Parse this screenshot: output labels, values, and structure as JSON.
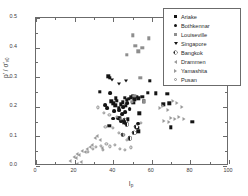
{
  "chart_data": {
    "type": "scatter",
    "title": "",
    "xlabel": "Ip",
    "xlabel_main": "I",
    "xlabel_sub": "p",
    "ylabel": "p'/σ'v0",
    "ylabel_num": "p'",
    "ylabel_den": "σ'",
    "ylabel_den_sub": "v0",
    "xlim": [
      0,
      100
    ],
    "ylim": [
      0.0,
      0.5
    ],
    "xticks": [
      0,
      20,
      40,
      60,
      80,
      100
    ],
    "xtick_labels": [
      "0",
      "20",
      "40",
      "60",
      "80",
      "100"
    ],
    "yticks": [
      0.0,
      0.1,
      0.2,
      0.3,
      0.4,
      0.5
    ],
    "ytick_labels": [
      "0.0",
      "0.1",
      "0.2",
      "0.3",
      "0.4",
      "0.5"
    ],
    "xminor_step": 10,
    "yminor_step": 0.05,
    "grid": false,
    "legend_position": "top-right",
    "series": [
      {
        "name": "Ariake",
        "marker": "filled-square",
        "color": "#141414",
        "points": [
          [
            33.0,
            0.251
          ],
          [
            37.5,
            0.303
          ],
          [
            38.2,
            0.297
          ],
          [
            39.0,
            0.219
          ],
          [
            40.0,
            0.212
          ],
          [
            41.0,
            0.205
          ],
          [
            41.5,
            0.229
          ],
          [
            42.0,
            0.221
          ],
          [
            43.0,
            0.196
          ],
          [
            43.5,
            0.161
          ],
          [
            44.0,
            0.208
          ],
          [
            45.0,
            0.215
          ],
          [
            46.0,
            0.231
          ],
          [
            46.5,
            0.203
          ],
          [
            47.0,
            0.223
          ],
          [
            48.0,
            0.228
          ],
          [
            49.0,
            0.232
          ],
          [
            50.0,
            0.236
          ],
          [
            50.5,
            0.214
          ],
          [
            51.0,
            0.225
          ],
          [
            52.0,
            0.233
          ],
          [
            53.0,
            0.229
          ],
          [
            53.5,
            0.178
          ],
          [
            55.0,
            0.233
          ],
          [
            56.0,
            0.219
          ],
          [
            58.0,
            0.247
          ],
          [
            59.0,
            0.288
          ],
          [
            62.0,
            0.245
          ],
          [
            66.0,
            0.208
          ],
          [
            68.0,
            0.243
          ],
          [
            69.0,
            0.212
          ],
          [
            70.0,
            0.131
          ],
          [
            81.0,
            0.149
          ],
          [
            38.0,
            0.135
          ],
          [
            45.5,
            0.147
          ],
          [
            52.5,
            0.129
          ],
          [
            53.0,
            0.117
          ],
          [
            47.5,
            0.158
          ]
        ]
      },
      {
        "name": "Bothkennar",
        "marker": "filled-circle",
        "color": "#141414",
        "points": [
          [
            36.0,
            0.205
          ],
          [
            37.0,
            0.196
          ],
          [
            38.5,
            0.247
          ],
          [
            40.5,
            0.186
          ],
          [
            42.5,
            0.163
          ],
          [
            43.0,
            0.19
          ],
          [
            44.5,
            0.176
          ],
          [
            45.0,
            0.2
          ],
          [
            46.0,
            0.182
          ],
          [
            47.0,
            0.213
          ],
          [
            48.5,
            0.192
          ],
          [
            40.0,
            0.16
          ],
          [
            44.0,
            0.151
          ],
          [
            53.0,
            0.143
          ]
        ]
      },
      {
        "name": "Louiseville",
        "marker": "small-square",
        "color": "#8e8e8e",
        "points": [
          [
            47.0,
            0.376
          ],
          [
            50.0,
            0.441
          ],
          [
            51.5,
            0.406
          ],
          [
            53.0,
            0.388
          ],
          [
            55.0,
            0.4
          ],
          [
            58.5,
            0.432
          ],
          [
            54.0,
            0.297
          ],
          [
            49.5,
            0.217
          ],
          [
            51.0,
            0.237
          ],
          [
            56.0,
            0.219
          ]
        ]
      },
      {
        "name": "Singapore",
        "marker": "filled-triangle-down",
        "color": "#141414",
        "points": [
          [
            39.5,
            0.289
          ],
          [
            43.0,
            0.276
          ],
          [
            46.5,
            0.286
          ]
        ]
      },
      {
        "name": "Bangkok",
        "marker": "half-filled-circle",
        "color": "#141414",
        "points": [
          [
            46.0,
            0.155
          ],
          [
            46.5,
            0.148
          ],
          [
            47.0,
            0.141
          ],
          [
            52.0,
            0.133
          ],
          [
            45.0,
            0.106
          ],
          [
            48.5,
            0.093
          ],
          [
            51.0,
            0.113
          ]
        ]
      },
      {
        "name": "Drammen",
        "marker": "open-triangle-left",
        "color": "#9a9a9a",
        "points": [
          [
            17.5,
            0.018
          ],
          [
            19.5,
            0.031
          ],
          [
            20.5,
            0.027
          ],
          [
            21.5,
            0.042
          ],
          [
            22.5,
            0.038
          ],
          [
            24.0,
            0.052
          ],
          [
            25.5,
            0.046
          ],
          [
            26.5,
            0.058
          ],
          [
            28.0,
            0.063
          ],
          [
            29.0,
            0.072
          ],
          [
            30.5,
            0.096
          ],
          [
            31.5,
            0.103
          ],
          [
            33.0,
            0.088
          ],
          [
            34.0,
            0.062
          ],
          [
            23.5,
            0.013
          ],
          [
            21.0,
            0.008
          ]
        ]
      },
      {
        "name": "Yamashita",
        "marker": "open-triangle-right",
        "color": "#9a9a9a",
        "points": [
          [
            64.5,
            0.196
          ],
          [
            66.0,
            0.203
          ],
          [
            68.5,
            0.188
          ],
          [
            71.0,
            0.221
          ],
          [
            73.0,
            0.214
          ],
          [
            75.5,
            0.198
          ],
          [
            70.0,
            0.163
          ],
          [
            72.0,
            0.158
          ],
          [
            74.0,
            0.166
          ],
          [
            76.5,
            0.16
          ],
          [
            66.5,
            0.152
          ],
          [
            69.0,
            0.147
          ]
        ]
      },
      {
        "name": "Pusan",
        "marker": "open-circle",
        "color": "#8e8e8e",
        "points": [
          [
            32.0,
            0.198
          ],
          [
            35.0,
            0.178
          ],
          [
            38.0,
            0.172
          ],
          [
            42.0,
            0.167
          ],
          [
            44.0,
            0.16
          ],
          [
            36.0,
            0.131
          ],
          [
            40.0,
            0.128
          ],
          [
            43.0,
            0.112
          ],
          [
            45.5,
            0.104
          ],
          [
            47.0,
            0.089
          ],
          [
            49.0,
            0.063
          ],
          [
            33.5,
            0.069
          ],
          [
            36.5,
            0.074
          ],
          [
            38.5,
            0.066
          ],
          [
            41.0,
            0.071
          ],
          [
            43.5,
            0.059
          ],
          [
            29.5,
            0.058
          ],
          [
            31.0,
            0.064
          ],
          [
            27.0,
            0.048
          ],
          [
            34.5,
            0.053
          ],
          [
            46.0,
            0.055
          ],
          [
            54.5,
            0.145
          ]
        ]
      }
    ]
  }
}
